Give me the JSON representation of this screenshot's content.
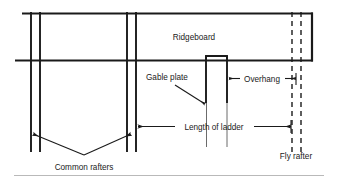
{
  "figure": {
    "kind": "architectural-construction-diagram",
    "background_color": "#ffffff",
    "line_color": "#1a1a1a",
    "rule_color": "#b9b9b9"
  },
  "labels": {
    "ridgeboard": "Ridgeboard",
    "gable_plate": "Gable plate",
    "overhang": "Overhang",
    "length_of_ladder": "Length of ladder",
    "fly_rafter": "Fly rafter",
    "common_rafters": "Common rafters"
  },
  "parts": {
    "ridgeboard": {
      "name": "Ridgeboard",
      "description": "Long horizontal board running across the top of the framing"
    },
    "gable_plate": {
      "name": "Gable plate",
      "description": "Vertical plate block near the middle right of the framing"
    },
    "fly_rafter": {
      "name": "Fly rafter",
      "description": "Hidden rafter shown with dashed vertical lines at the right"
    },
    "common_rafters": {
      "name": "Common rafters",
      "description": "Pair of vertical rafters at the left of the framing"
    }
  },
  "dimensions": [
    {
      "name": "Overhang",
      "label": "Overhang",
      "arrow_style": "double-headed",
      "orientation": "horizontal"
    },
    {
      "name": "Length of ladder",
      "label": "Length of ladder",
      "arrow_style": "double-headed",
      "orientation": "horizontal"
    }
  ],
  "leaders": [
    {
      "name": "gable-plate-leader",
      "label": "Gable plate",
      "arrow_style": "single-headed"
    },
    {
      "name": "common-rafters-leader-left",
      "label": "Common rafters",
      "arrow_style": "single-headed"
    },
    {
      "name": "common-rafters-leader-right",
      "label": "Common rafters",
      "arrow_style": "single-headed"
    }
  ]
}
